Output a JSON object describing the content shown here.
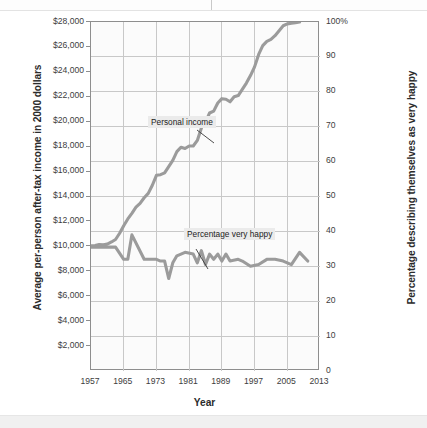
{
  "chart_data": {
    "type": "line",
    "title": "",
    "xlabel": "Year",
    "ylabel": "Average per-person after-tax income in 2000 dollars",
    "ylabel_right": "Percentage describing themselves as very happy",
    "grid": true,
    "legend": "inline-annotations",
    "xlim": [
      1957,
      2013
    ],
    "xticks": [
      "1957",
      "1965",
      "1973",
      "1981",
      "1989",
      "1997",
      "2005",
      "2013"
    ],
    "xtick_values": [
      1957,
      1965,
      1973,
      1981,
      1989,
      1997,
      2005,
      2013
    ],
    "ylim_left": [
      0,
      28000
    ],
    "yticks_left": [
      "$2,000",
      "$4,000",
      "$6,000",
      "$8,000",
      "$10,000",
      "$12,000",
      "$14,000",
      "$16,000",
      "$18,000",
      "$20,000",
      "$22,000",
      "$24,000",
      "$26,000",
      "$28,000"
    ],
    "ytick_values_left": [
      2000,
      4000,
      6000,
      8000,
      10000,
      12000,
      14000,
      16000,
      18000,
      20000,
      22000,
      24000,
      26000,
      28000
    ],
    "ylim_right": [
      0,
      100
    ],
    "yticks_right": [
      "0",
      "10",
      "20",
      "30",
      "40",
      "50",
      "60",
      "70",
      "80",
      "90",
      "100%"
    ],
    "ytick_values_right": [
      0,
      10,
      20,
      30,
      40,
      50,
      60,
      70,
      80,
      90,
      100
    ],
    "series": [
      {
        "name": "Personal income",
        "axis": "left",
        "color": "#9b9b9b",
        "x": [
          1957,
          1958,
          1959,
          1960,
          1961,
          1962,
          1963,
          1964,
          1965,
          1966,
          1967,
          1968,
          1969,
          1970,
          1971,
          1972,
          1973,
          1974,
          1975,
          1976,
          1977,
          1978,
          1979,
          1980,
          1981,
          1982,
          1983,
          1984,
          1985,
          1986,
          1987,
          1988,
          1989,
          1990,
          1991,
          1992,
          1993,
          1994,
          1995,
          1996,
          1997,
          1998,
          1999,
          2000,
          2001,
          2002,
          2003,
          2004,
          2005,
          2006,
          2007,
          2008
        ],
        "values": [
          10050,
          10070,
          10150,
          10120,
          10180,
          10350,
          10550,
          11050,
          11650,
          12200,
          12650,
          13150,
          13450,
          13900,
          14250,
          14900,
          15700,
          15750,
          15900,
          16400,
          16900,
          17600,
          17950,
          17850,
          18050,
          18050,
          18500,
          19500,
          19950,
          20700,
          20850,
          21500,
          21850,
          21800,
          21600,
          22000,
          22100,
          22600,
          23100,
          23700,
          24400,
          25400,
          26100,
          26450,
          26600,
          26900,
          27300,
          27700,
          27850,
          27900,
          27950,
          28000
        ]
      },
      {
        "name": "Percentage very happy",
        "axis": "right",
        "color": "#9b9b9b",
        "x": [
          1957,
          1960,
          1963,
          1965,
          1966,
          1967,
          1970,
          1971,
          1972,
          1973,
          1974,
          1975,
          1976,
          1977,
          1978,
          1980,
          1982,
          1983,
          1984,
          1985,
          1986,
          1987,
          1988,
          1989,
          1990,
          1991,
          1993,
          1994,
          1996,
          1998,
          2000,
          2002,
          2004,
          2006,
          2008,
          2010
        ],
        "values": [
          35.5,
          35.5,
          35.5,
          32.0,
          32.0,
          39.0,
          32.0,
          32.0,
          32.0,
          32.0,
          31.5,
          31.5,
          26.5,
          31.0,
          33.0,
          34.0,
          33.5,
          31.0,
          34.5,
          30.5,
          33.5,
          32.0,
          33.5,
          31.5,
          33.5,
          31.5,
          32.0,
          31.5,
          30.0,
          30.5,
          32.0,
          32.0,
          31.5,
          30.5,
          34.0,
          31.5
        ]
      }
    ],
    "annotations": [
      {
        "text": "Personal income",
        "x_px": 148,
        "y_px": 116
      },
      {
        "text": "Percentage very happy",
        "x_px": 184,
        "y_px": 228
      }
    ]
  }
}
